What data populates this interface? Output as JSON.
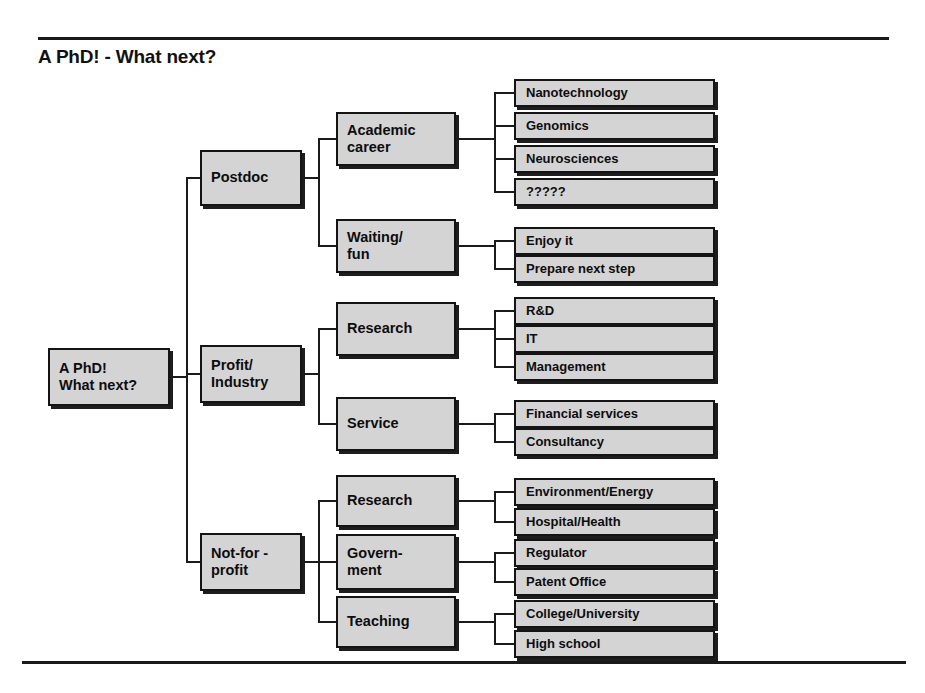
{
  "document": {
    "title": "A PhD! - What next?",
    "rules": {
      "visible": true
    }
  },
  "diagram": {
    "type": "tree",
    "root": {
      "label": "A PhD!\nWhat next?"
    },
    "branches": [
      {
        "label": "Postdoc",
        "children": [
          {
            "label": "Academic\ncareer",
            "leaves": [
              {
                "label": "Nanotechnology"
              },
              {
                "label": "Genomics"
              },
              {
                "label": "Neurosciences"
              },
              {
                "label": "?????"
              }
            ]
          },
          {
            "label": "Waiting/\nfun",
            "leaves": [
              {
                "label": "Enjoy it"
              },
              {
                "label": "Prepare next step"
              }
            ]
          }
        ]
      },
      {
        "label": "Profit/\nIndustry",
        "children": [
          {
            "label": "Research",
            "leaves": [
              {
                "label": "R&D"
              },
              {
                "label": "IT"
              },
              {
                "label": "Management"
              }
            ]
          },
          {
            "label": "Service",
            "leaves": [
              {
                "label": "Financial services"
              },
              {
                "label": "Consultancy"
              }
            ]
          }
        ]
      },
      {
        "label": "Not-for -\nprofit",
        "children": [
          {
            "label": "Research",
            "leaves": [
              {
                "label": "Environment/Energy"
              },
              {
                "label": "Hospital/Health"
              }
            ]
          },
          {
            "label": "Govern-\nment",
            "leaves": [
              {
                "label": "Regulator"
              },
              {
                "label": "Patent Office"
              }
            ]
          },
          {
            "label": "Teaching",
            "leaves": [
              {
                "label": "College/University"
              },
              {
                "label": "High school"
              }
            ]
          }
        ]
      }
    ]
  },
  "colors": {
    "box_fill": "#d4d4d4",
    "box_border": "#141414",
    "shadow": "#1d1d1d",
    "line": "#1b1b1b",
    "text": "#0d0d0d",
    "background": "#ffffff"
  }
}
